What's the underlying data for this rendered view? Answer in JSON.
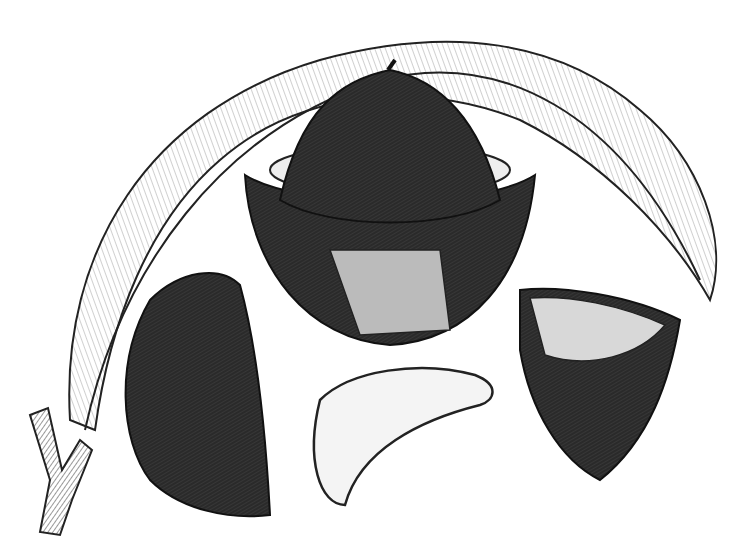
{
  "image": {
    "subject": "Engraved botanical illustration of Brazil nut fruit, nuts and leaf",
    "style": "black and white wood engraving",
    "background": "#ffffff",
    "ink": "#1a1a1a",
    "elements": [
      "leaf",
      "open-fruit-pod",
      "seed-capsule",
      "shelled-nut",
      "broken-shell",
      "stem"
    ]
  }
}
